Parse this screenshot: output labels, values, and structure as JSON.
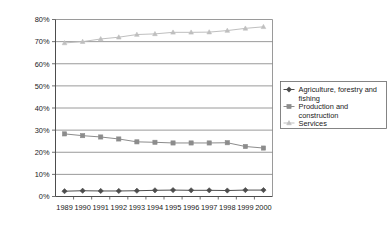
{
  "chart_data": {
    "type": "line",
    "title": "",
    "xlabel": "",
    "ylabel": "",
    "ylim": [
      0,
      80
    ],
    "ytick_labels": [
      "0%",
      "10%",
      "20%",
      "30%",
      "40%",
      "50%",
      "60%",
      "70%",
      "80%"
    ],
    "ytick_values": [
      0,
      10,
      20,
      30,
      40,
      50,
      60,
      70,
      80
    ],
    "grid": true,
    "legend_position": "right",
    "categories": [
      "1989",
      "1990",
      "1991",
      "1992",
      "1993",
      "1994",
      "1995",
      "1996",
      "1997",
      "1998",
      "1999",
      "2000"
    ],
    "series": [
      {
        "name": "Agriculture, forestry and fishing",
        "marker": "diamond",
        "color": "#4d4d4d",
        "values": [
          2.4,
          2.6,
          2.5,
          2.5,
          2.6,
          2.8,
          2.9,
          2.8,
          2.8,
          2.7,
          2.9,
          2.9
        ]
      },
      {
        "name": "Production and construction",
        "marker": "square",
        "color": "#8c8c8c",
        "values": [
          28.3,
          27.5,
          26.9,
          26.0,
          24.7,
          24.5,
          24.2,
          24.2,
          24.2,
          24.3,
          22.6,
          21.9
        ]
      },
      {
        "name": "Services",
        "marker": "triangle",
        "color": "#bfbfbf",
        "values": [
          69.4,
          70.0,
          71.2,
          72.0,
          73.2,
          73.5,
          74.2,
          74.2,
          74.3,
          75.0,
          76.0,
          76.7
        ]
      }
    ]
  },
  "legend": {
    "entries": [
      {
        "label_line1": "Agriculture, forestry and",
        "label_line2": "fishing"
      },
      {
        "label_line1": "Production and",
        "label_line2": "construction"
      },
      {
        "label_line1": "Services",
        "label_line2": ""
      }
    ]
  }
}
